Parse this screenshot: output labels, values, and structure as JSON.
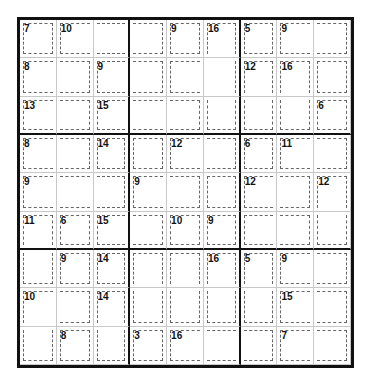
{
  "puzzle": {
    "type": "killer-sudoku",
    "size": 9,
    "cage_grid": [
      [
        "a",
        "b",
        "b",
        "b",
        "c",
        "d",
        "e",
        "f",
        "f"
      ],
      [
        "g",
        "g",
        "h",
        "h",
        "d",
        "d",
        "i",
        "j",
        "k"
      ],
      [
        "l",
        "l",
        "m",
        "m",
        "m",
        "d",
        "i",
        "j",
        "n"
      ],
      [
        "o",
        "o",
        "p",
        "q",
        "r",
        "r",
        "s",
        "t",
        "t"
      ],
      [
        "u",
        "u",
        "u",
        "v",
        "v",
        "w",
        "x",
        "x",
        "y"
      ],
      [
        "z",
        "A",
        "B",
        "B",
        "C",
        "D",
        "E",
        "E",
        "y"
      ],
      [
        "z",
        "F",
        "G",
        "H",
        "I",
        "J",
        "K",
        "L",
        "L"
      ],
      [
        "M",
        "M",
        "N",
        "H",
        "I",
        "J",
        "K",
        "O",
        "O"
      ],
      [
        "M",
        "P",
        "N",
        "Q",
        "R",
        "R",
        "R",
        "S",
        "S"
      ]
    ],
    "cages": {
      "a": 7,
      "b": 10,
      "c": 9,
      "d": 16,
      "e": 5,
      "f": 9,
      "g": 8,
      "h": 9,
      "i": 12,
      "j": 16,
      "k": 0,
      "l": 13,
      "m": 15,
      "n": 6,
      "o": 8,
      "p": 14,
      "q": 0,
      "r": 12,
      "s": 6,
      "t": 11,
      "u": 9,
      "v": 9,
      "w": 0,
      "x": 12,
      "y": 12,
      "z": 11,
      "A": 6,
      "B": 15,
      "C": 10,
      "D": 9,
      "E": 0,
      "F": 9,
      "G": 14,
      "H": 0,
      "I": 0,
      "J": 16,
      "K": 5,
      "L": 9,
      "M": 10,
      "N": 14,
      "O": 15,
      "P": 8,
      "Q": 3,
      "R": 16,
      "S": 7
    },
    "labels": [
      {
        "r": 0,
        "c": 0,
        "sum": "7"
      },
      {
        "r": 0,
        "c": 1,
        "sum": "10"
      },
      {
        "r": 0,
        "c": 4,
        "sum": "9"
      },
      {
        "r": 0,
        "c": 5,
        "sum": "16"
      },
      {
        "r": 0,
        "c": 6,
        "sum": "5"
      },
      {
        "r": 0,
        "c": 7,
        "sum": "9"
      },
      {
        "r": 1,
        "c": 0,
        "sum": "8"
      },
      {
        "r": 1,
        "c": 2,
        "sum": "9"
      },
      {
        "r": 1,
        "c": 6,
        "sum": "12"
      },
      {
        "r": 1,
        "c": 7,
        "sum": "16"
      },
      {
        "r": 2,
        "c": 0,
        "sum": "13"
      },
      {
        "r": 2,
        "c": 2,
        "sum": "15"
      },
      {
        "r": 2,
        "c": 8,
        "sum": "6"
      },
      {
        "r": 3,
        "c": 0,
        "sum": "8"
      },
      {
        "r": 3,
        "c": 2,
        "sum": "14"
      },
      {
        "r": 3,
        "c": 4,
        "sum": "12"
      },
      {
        "r": 3,
        "c": 6,
        "sum": "6"
      },
      {
        "r": 3,
        "c": 7,
        "sum": "11"
      },
      {
        "r": 4,
        "c": 0,
        "sum": "9"
      },
      {
        "r": 4,
        "c": 3,
        "sum": "9"
      },
      {
        "r": 4,
        "c": 6,
        "sum": "12"
      },
      {
        "r": 4,
        "c": 8,
        "sum": "12"
      },
      {
        "r": 5,
        "c": 0,
        "sum": "11"
      },
      {
        "r": 5,
        "c": 1,
        "sum": "6"
      },
      {
        "r": 5,
        "c": 2,
        "sum": "15"
      },
      {
        "r": 5,
        "c": 4,
        "sum": "10"
      },
      {
        "r": 5,
        "c": 5,
        "sum": "9"
      },
      {
        "r": 6,
        "c": 1,
        "sum": "9"
      },
      {
        "r": 6,
        "c": 2,
        "sum": "14"
      },
      {
        "r": 6,
        "c": 5,
        "sum": "16"
      },
      {
        "r": 6,
        "c": 6,
        "sum": "5"
      },
      {
        "r": 6,
        "c": 7,
        "sum": "9"
      },
      {
        "r": 7,
        "c": 0,
        "sum": "10"
      },
      {
        "r": 7,
        "c": 2,
        "sum": "14"
      },
      {
        "r": 7,
        "c": 7,
        "sum": "15"
      },
      {
        "r": 8,
        "c": 1,
        "sum": "8"
      },
      {
        "r": 8,
        "c": 3,
        "sum": "3"
      },
      {
        "r": 8,
        "c": 4,
        "sum": "16"
      },
      {
        "r": 8,
        "c": 7,
        "sum": "7"
      }
    ]
  }
}
